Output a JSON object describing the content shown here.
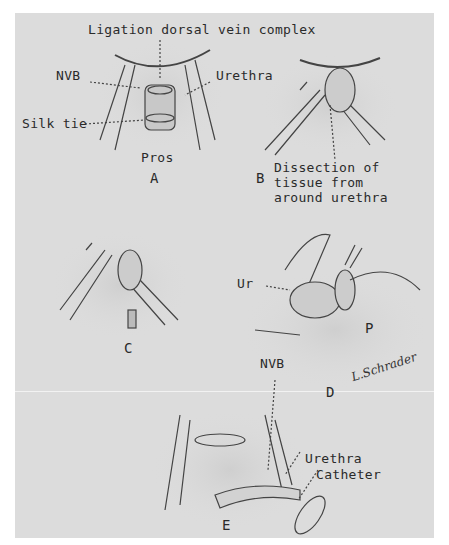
{
  "figure": {
    "panels": [
      {
        "id": "A",
        "label": "A",
        "annotations": [
          "Ligation dorsal vein complex",
          "NVB",
          "Urethra",
          "Silk tie",
          "Pros"
        ]
      },
      {
        "id": "B",
        "label": "B",
        "annotations": [
          "Dissection of",
          "tissue from",
          "around urethra"
        ]
      },
      {
        "id": "C",
        "label": "C",
        "annotations": []
      },
      {
        "id": "D",
        "label": "D",
        "annotations": [
          "Ur",
          "P",
          "NVB"
        ]
      },
      {
        "id": "E",
        "label": "E",
        "annotations": [
          "Urethra",
          "Catheter"
        ]
      }
    ],
    "signature": "L.Schrader"
  },
  "labels": {
    "a_title": "Ligation dorsal vein complex",
    "a_nvb": "NVB",
    "a_urethra": "Urethra",
    "a_silk": "Silk tie",
    "a_pros": "Pros",
    "a_letter": "A",
    "b_letter": "B",
    "b_line1": "Dissection of",
    "b_line2": "tissue from",
    "b_line3": "around urethra",
    "c_letter": "C",
    "d_ur": "Ur",
    "d_p": "P",
    "d_nvb": "NVB",
    "d_letter": "D",
    "e_urethra": "Urethra",
    "e_catheter": "Catheter",
    "e_letter": "E"
  },
  "colors": {
    "panel": "#dcdcdc",
    "ink": "#2a2a2a",
    "background": "#ffffff"
  }
}
